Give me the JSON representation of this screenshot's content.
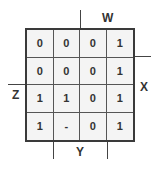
{
  "kmap": {
    "labels": {
      "w": "W",
      "x": "X",
      "y": "Y",
      "z": "Z"
    },
    "rows": [
      [
        "0",
        "0",
        "0",
        "1"
      ],
      [
        "0",
        "0",
        "0",
        "1"
      ],
      [
        "1",
        "1",
        "0",
        "1"
      ],
      [
        "1",
        "-",
        "0",
        "1"
      ]
    ]
  }
}
